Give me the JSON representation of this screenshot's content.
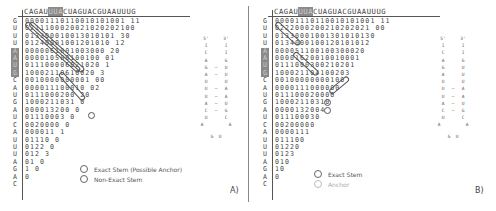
{
  "sequence_header": {
    "before": "CAGAU",
    "highlight": "UUA",
    "after": "CUAGUACGUAAUUUG"
  },
  "row_labels": [
    "G",
    "U",
    "U",
    "U",
    "A",
    "A",
    "U",
    "G",
    "C",
    "A",
    "U",
    "G",
    "A",
    "U",
    "C",
    "A",
    "U",
    "U",
    "U",
    "A",
    "G",
    "A",
    "C"
  ],
  "highlighted_rows": [
    4,
    5,
    6,
    7
  ],
  "panel_a": {
    "label": "A)",
    "matrix": [
      "00001110110010101001 11",
      "0211100020021020202100",
      "013300010013010101 30",
      "01240001001201010 12",
      "0000061001003000 20",
      "000010500100100 01",
      "011100006021020 1",
      "10002110610020 3",
      "0010000000001 00",
      "000011100010 02",
      "0111000200 20",
      "1000211031 0",
      "000013200 0",
      "01110003 0",
      "0020000 0",
      "000011 1",
      "01110 0",
      "0122 0",
      "012 3",
      "01 0",
      "1 0",
      "0",
      ""
    ],
    "legend": [
      {
        "label": "Exact Stem (Possible Anchor)",
        "style": "dark"
      },
      {
        "label": "Non-Exact Stem",
        "style": "dark"
      }
    ],
    "structure": {
      "five_prime": "5'",
      "three_prime": "3'",
      "pairs": [
        [
          "I",
          "I",
          ""
        ],
        [
          "C",
          "I",
          ""
        ],
        [
          "A",
          "G",
          ""
        ],
        [
          "G",
          "U",
          "—"
        ],
        [
          "A",
          "U",
          "—"
        ],
        [
          "U",
          "U",
          ""
        ],
        [
          "U",
          "A",
          "—"
        ],
        [
          "U",
          "A",
          "—"
        ],
        [
          "A",
          "U",
          "—"
        ],
        [
          "C",
          "G",
          "—"
        ],
        [
          "U",
          "C",
          ""
        ]
      ],
      "loop_mid": [
        "A",
        "A"
      ],
      "loop_bottom": [
        "G",
        "U"
      ]
    }
  },
  "panel_b": {
    "label": "B)",
    "matrix": [
      "00001110110010101001 11",
      "0222000200210202021 00",
      "01330001001301010130",
      "0134000100120101012",
      "000051100100300020",
      "00001620010010001",
      "0111000300210201",
      "100021104100203",
      "00100000000100",
      "0000111000000",
      "011100020000",
      "10002110310",
      "0000132004",
      "011100030",
      "00200000",
      "0000111",
      "011100",
      "01220",
      "0123",
      "010",
      "10",
      "0",
      ""
    ],
    "legend": [
      {
        "label": "Exact Stem",
        "style": "dark"
      },
      {
        "label": "Anchor",
        "style": "light"
      }
    ],
    "structure": {
      "five_prime": "5'",
      "three_prime": "3'",
      "pairs": [
        [
          "I",
          "I",
          ""
        ],
        [
          "C",
          "I",
          ""
        ],
        [
          "A",
          "G",
          ""
        ],
        [
          "G",
          "U",
          ""
        ],
        [
          "A",
          "U",
          ""
        ],
        [
          "U",
          "U",
          ""
        ],
        [
          "U",
          "A",
          "—"
        ],
        [
          "U",
          "A",
          "—"
        ],
        [
          "A",
          "U",
          "—"
        ],
        [
          "C",
          "G",
          "—"
        ],
        [
          "U",
          "C",
          ""
        ]
      ],
      "loop_mid": [
        "A",
        "A"
      ],
      "loop_bottom": [
        "G",
        "U"
      ]
    }
  },
  "colors": {
    "text": "#444444",
    "highlight_bg": "#8a8a8a",
    "line": "#555555",
    "anchor_light": "#bbbbbb"
  }
}
